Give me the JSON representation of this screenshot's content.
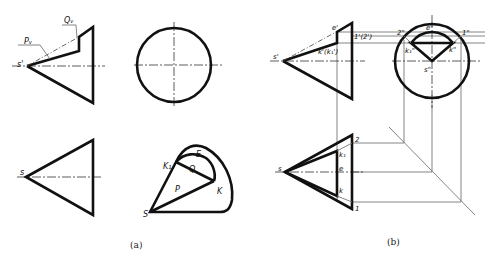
{
  "figure_a": {
    "caption": "(a)",
    "labels": {
      "s_prime": "s'",
      "p_v": "Pᵥ",
      "q_v": "Qᵥ",
      "s": "s",
      "big_s": "S",
      "k1": "K₁",
      "e": "E",
      "q": "Q",
      "p": "P",
      "k": "K"
    }
  },
  "figure_b": {
    "caption": "(b)",
    "labels": {
      "e_prime": "e'",
      "one_two_prime": "1'(2')",
      "s_prime": "s'",
      "k_prime": "k'(k₁')",
      "two_dprime": "2\"",
      "e_dprime": "e\"",
      "one_dprime": "1\"",
      "k1_dprime": "k₁\"",
      "k_dprime": "k\"",
      "s_dprime": "s\"",
      "s": "s",
      "two": "2",
      "k1": "k₁",
      "e": "e",
      "k": "k",
      "one": "1"
    }
  }
}
